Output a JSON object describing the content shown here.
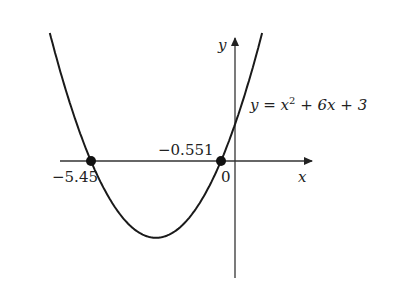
{
  "chart_data": {
    "type": "line",
    "title": "",
    "equation_label": {
      "prefix": "y = x",
      "exp": "2",
      "suffix": " + 6x + 3"
    },
    "function": "y = x^2 + 6x + 3",
    "xlabel": "x",
    "ylabel": "y",
    "origin_label": "0",
    "roots": [
      {
        "x": -5.45,
        "label": "−5.45"
      },
      {
        "x": -0.551,
        "label": "−0.551"
      }
    ],
    "vertex": {
      "x": -3,
      "y": -6
    },
    "xlim": [
      -6.5,
      2.8
    ],
    "ylim": [
      -9,
      10
    ],
    "grid": false,
    "legend": "none"
  }
}
